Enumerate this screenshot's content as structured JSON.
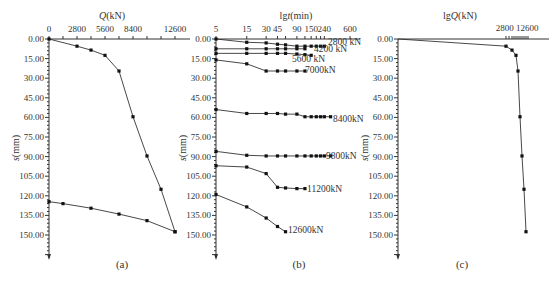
{
  "chart_data": [
    {
      "panel": "(a)",
      "type": "line",
      "title": "",
      "xlabel": "Q(kN)",
      "ylabel": "s(mm)",
      "x_ticks": [
        "0",
        "2800",
        "5600",
        "8400",
        "12600"
      ],
      "y_ticks": [
        "0.00",
        "15.00",
        "30.00",
        "45.00",
        "60.00",
        "75.00",
        "90.00",
        "105.00",
        "120.00",
        "135.00",
        "150.00"
      ],
      "xlim": [
        0,
        12600
      ],
      "ylim": [
        0,
        150
      ],
      "y_inverted": true,
      "x_axis_position": "top",
      "series": [
        {
          "name": "loading",
          "x": [
            0,
            2800,
            4200,
            5600,
            7000,
            8400,
            9800,
            11200,
            12600
          ],
          "y": [
            0,
            5.5,
            8.5,
            12.5,
            24.5,
            59.5,
            89.5,
            115.0,
            147.5
          ]
        },
        {
          "name": "unloading",
          "x": [
            12600,
            9800,
            7000,
            4200,
            1400,
            0
          ],
          "y": [
            147.5,
            139.0,
            134.0,
            129.5,
            126.0,
            124.5
          ]
        }
      ]
    },
    {
      "panel": "(b)",
      "type": "line",
      "xlabel": "lgt(min)",
      "ylabel": "s(mm)",
      "x_scale": "log",
      "x_ticks": [
        "5",
        "15",
        "30",
        "45",
        "90",
        "150",
        "240",
        "600"
      ],
      "y_ticks": [
        "0.00",
        "15.00",
        "30.00",
        "45.00",
        "60.00",
        "75.00",
        "90.00",
        "105.00",
        "120.00",
        "135.00",
        "150.00"
      ],
      "ylim": [
        0,
        150
      ],
      "y_inverted": true,
      "x_axis_position": "top",
      "series": [
        {
          "name": "2800kN",
          "label": "2800 kN",
          "t": [
            5,
            15,
            30,
            45,
            60,
            90,
            120,
            150,
            180,
            210,
            240
          ],
          "s": [
            0.0,
            2.5,
            3.0,
            4.0,
            4.5,
            5.5,
            5.5,
            5.5,
            5.5,
            5.5,
            5.5
          ]
        },
        {
          "name": "4200kN",
          "label": "4200 kN",
          "t": [
            5,
            15,
            30,
            45,
            60,
            90,
            120
          ],
          "s": [
            7.5,
            7.5,
            7.5,
            7.5,
            7.5,
            7.5,
            7.5
          ]
        },
        {
          "name": "5600kN",
          "label": "5600 kN",
          "t": [
            5,
            15,
            30,
            45,
            60,
            90,
            120,
            150
          ],
          "s": [
            11.0,
            11.0,
            11.0,
            11.0,
            11.0,
            11.5,
            12.0,
            12.5
          ]
        },
        {
          "name": "7000kN",
          "label": "7000kN",
          "t": [
            5,
            15,
            30,
            45,
            60,
            90,
            120
          ],
          "s": [
            16.0,
            19.0,
            24.5,
            24.5,
            24.5,
            24.5,
            24.5
          ]
        },
        {
          "name": "8400kN",
          "label": "8400kN",
          "t": [
            5,
            15,
            30,
            45,
            60,
            90,
            120,
            150,
            180,
            210,
            240,
            300
          ],
          "s": [
            54.0,
            57.0,
            57.0,
            57.0,
            57.5,
            57.5,
            59.5,
            59.5,
            59.5,
            59.5,
            59.5,
            59.5
          ]
        },
        {
          "name": "9800kN",
          "label": "9800kN",
          "t": [
            5,
            15,
            30,
            45,
            60,
            90,
            120,
            150,
            180,
            210,
            240,
            300
          ],
          "s": [
            86.0,
            89.0,
            89.5,
            89.5,
            89.5,
            89.5,
            89.5,
            89.5,
            89.5,
            89.5,
            89.5,
            89.5
          ]
        },
        {
          "name": "11200kN",
          "label": "11200kN",
          "t": [
            5,
            15,
            30,
            45,
            60,
            90,
            120
          ],
          "s": [
            97.0,
            98.0,
            103.0,
            113.5,
            114.0,
            114.5,
            114.5
          ]
        },
        {
          "name": "12600kN",
          "label": "12600kN",
          "t": [
            5,
            15,
            30,
            45,
            60
          ],
          "s": [
            119.0,
            128.5,
            137.0,
            143.5,
            147.5
          ]
        }
      ]
    },
    {
      "panel": "(c)",
      "type": "line",
      "xlabel": "lgQ(kN)",
      "ylabel": "s(mm)",
      "x_scale": "log",
      "x_ticks": [
        "2800",
        "12600"
      ],
      "y_ticks": [
        "0.00",
        "15.00",
        "30.00",
        "45.00",
        "60.00",
        "75.00",
        "90.00",
        "105.00",
        "120.00",
        "135.00",
        "150.00"
      ],
      "ylim": [
        0,
        150
      ],
      "y_inverted": true,
      "x_axis_position": "top",
      "series": [
        {
          "name": "lgQ-s",
          "x": [
            0,
            2800,
            4200,
            5600,
            7000,
            8400,
            9800,
            11200,
            12600
          ],
          "y": [
            0,
            5.5,
            8.5,
            12.5,
            24.5,
            59.5,
            89.5,
            115.0,
            147.5
          ]
        }
      ]
    }
  ],
  "panels": {
    "a": {
      "label": "(a)",
      "xlabel": "Q(kN)",
      "ylabel": "s(mm)"
    },
    "b": {
      "label": "(b)",
      "xlabel": "lgt(min)",
      "ylabel": "s(mm)"
    },
    "c": {
      "label": "(c)",
      "xlabel": "lgQ(kN)",
      "ylabel": "s(mm)"
    }
  }
}
